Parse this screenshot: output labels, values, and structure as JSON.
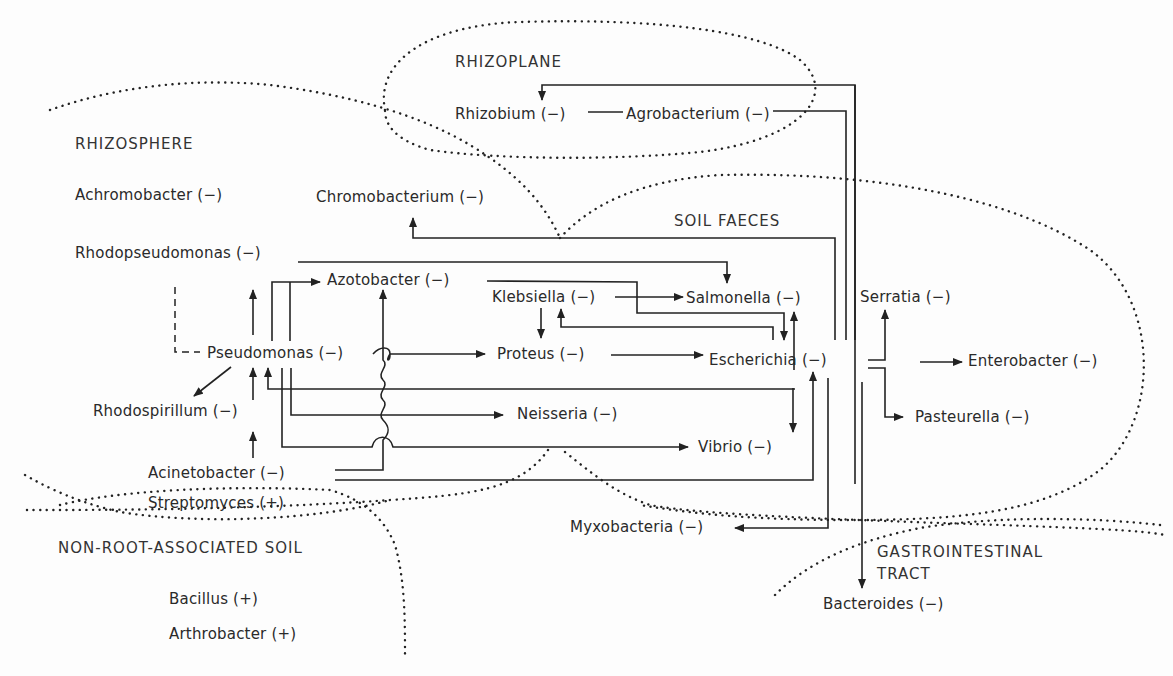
{
  "regions": {
    "rhizoplane": "RHIZOPLANE",
    "rhizosphere": "RHIZOSPHERE",
    "soil_faeces": "SOIL FAECES",
    "non_root_soil": "NON-ROOT-ASSOCIATED SOIL",
    "gastrointestinal_1": "GASTROINTESTINAL",
    "gastrointestinal_2": "TRACT"
  },
  "organisms": {
    "rhizobium": "Rhizobium (−)",
    "agrobacterium": "Agrobacterium (−)",
    "achromobacter": "Achromobacter (−)",
    "chromobacterium": "Chromobacterium (−)",
    "rhodopseudomonas": "Rhodopseudomonas (−)",
    "azotobacter": "Azotobacter (−)",
    "klebsiella": "Klebsiella (−)",
    "salmonella": "Salmonella (−)",
    "serratia": "Serratia (−)",
    "pseudomonas": "Pseudomonas (−)",
    "proteus": "Proteus (−)",
    "escherichia": "Escherichia (−)",
    "enterobacter": "Enterobacter (−)",
    "rhodospirillum": "Rhodospirillum (−)",
    "neisseria": "Neisseria (−)",
    "pasteurella": "Pasteurella (−)",
    "vibrio": "Vibrio (−)",
    "acinetobacter": "Acinetobacter (−)",
    "streptomyces": "Streptomyces (+)",
    "myxobacteria": "Myxobacteria (−)",
    "bacillus": "Bacillus (+)",
    "arthrobacter": "Arthrobacter (+)",
    "bacteroides": "Bacteroides (−)"
  },
  "colors": {
    "line": "#222222",
    "text": "#2a2a2a",
    "background": "#fdfdfd"
  }
}
